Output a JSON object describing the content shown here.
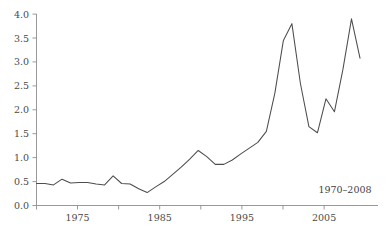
{
  "chart_data": {
    "type": "line",
    "title": "",
    "subtitle": "",
    "xlabel": "",
    "ylabel": "",
    "annotation": "1970–2008",
    "grid": false,
    "legend": false,
    "legend_position": "none",
    "line_color": "#4d4d4d",
    "axis_color": "#8d8d8d",
    "background_color": "#ffffff",
    "xlim": [
      1970,
      2008
    ],
    "ylim": [
      0.0,
      4.0
    ],
    "yticks": [
      0.0,
      0.5,
      1.0,
      1.5,
      2.0,
      2.5,
      3.0,
      3.5,
      4.0
    ],
    "ytick_labels": [
      "0.0",
      "0.5",
      "1.0",
      "1.5",
      "2.0",
      "2.5",
      "3.0",
      "3.5",
      "4.0"
    ],
    "xticks": [
      1970,
      1975,
      1980,
      1985,
      1990,
      1995,
      2000,
      2005
    ],
    "xtick_labels": [
      "",
      "1975",
      "",
      "1985",
      "",
      "1995",
      "",
      "2005"
    ],
    "x": [
      1970,
      1971,
      1972,
      1973,
      1974,
      1975,
      1976,
      1977,
      1978,
      1979,
      1980,
      1981,
      1982,
      1983,
      1984,
      1985,
      1986,
      1987,
      1988,
      1989,
      1990,
      1991,
      1992,
      1993,
      1994,
      1995,
      1996,
      1997,
      1998,
      1999,
      2000,
      2001,
      2002,
      2003,
      2004,
      2005,
      2006,
      2007,
      2008
    ],
    "values": [
      0.46,
      0.46,
      0.43,
      0.55,
      0.47,
      0.48,
      0.48,
      0.45,
      0.43,
      0.62,
      0.46,
      0.45,
      0.35,
      0.27,
      0.39,
      0.5,
      0.65,
      0.8,
      0.97,
      1.15,
      1.02,
      0.86,
      0.86,
      0.95,
      1.08,
      1.2,
      1.32,
      1.55,
      2.35,
      3.45,
      3.8,
      2.55,
      1.65,
      1.52,
      2.23,
      1.96,
      2.85,
      3.9,
      3.08
    ],
    "series_name": ""
  },
  "axis": {
    "y_label_0": "0.0",
    "y_label_1": "0.5",
    "y_label_2": "1.0",
    "y_label_3": "1.5",
    "y_label_4": "2.0",
    "y_label_5": "2.5",
    "y_label_6": "3.0",
    "y_label_7": "3.5",
    "y_label_8": "4.0",
    "x_label_1975": "1975",
    "x_label_1985": "1985",
    "x_label_1995": "1995",
    "x_label_2005": "2005"
  },
  "annotation": {
    "range_label": "1970–2008"
  }
}
